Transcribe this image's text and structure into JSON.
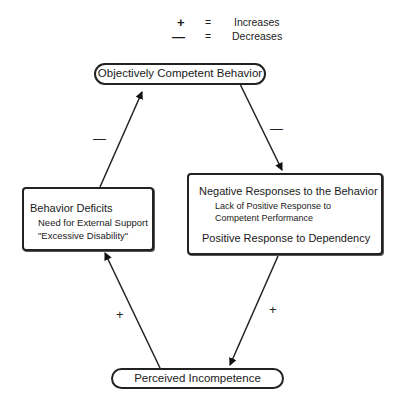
{
  "legend": {
    "items": [
      {
        "symbol": "+",
        "equals": "=",
        "meaning": "Increases"
      },
      {
        "symbol": "—",
        "equals": "=",
        "meaning": "Decreases"
      }
    ]
  },
  "nodes": {
    "top": {
      "label": "Objectively Competent Behavior"
    },
    "right": {
      "title": "Negative Responses to the Behavior",
      "sub1": "Lack of Positive Response to",
      "sub2": "Competent Performance",
      "line2": "Positive Response to Dependency"
    },
    "bottom": {
      "label": "Perceived Incompetence"
    },
    "left": {
      "title": "Behavior Deficits",
      "sub1": "Need for External Support",
      "sub2": "\"Excessive Disability\""
    }
  },
  "edges": [
    {
      "from": "top",
      "to": "right",
      "sign": "—"
    },
    {
      "from": "right",
      "to": "bottom",
      "sign": "+"
    },
    {
      "from": "bottom",
      "to": "left",
      "sign": "+"
    },
    {
      "from": "left",
      "to": "top",
      "sign": "—"
    }
  ]
}
